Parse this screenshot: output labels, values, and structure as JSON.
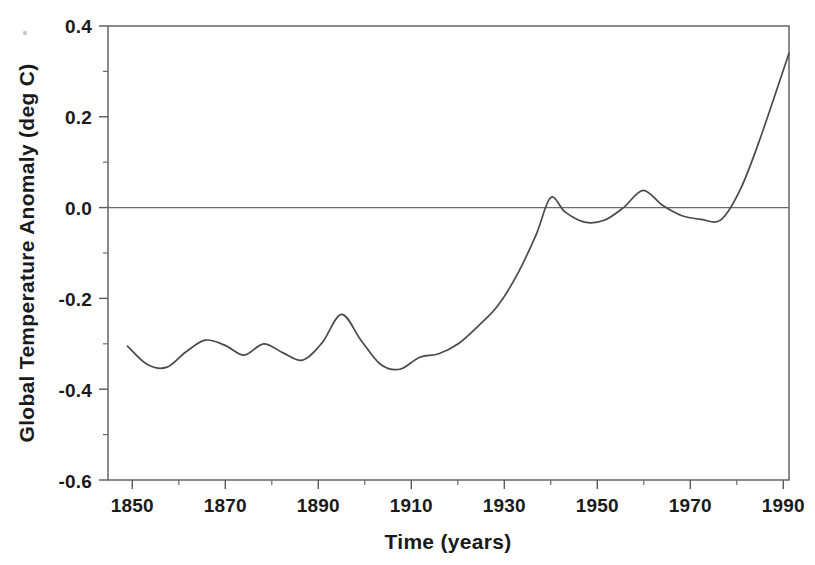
{
  "chart_data": {
    "type": "line",
    "title": "",
    "xlabel": "Time (years)",
    "ylabel": "Global Temperature Anomaly (deg C)",
    "xlim": [
      1850,
      1990
    ],
    "ylim": [
      -0.6,
      0.4
    ],
    "grid": false,
    "legend": null,
    "zero_reference_line": 0.0,
    "x_major_ticks": [
      1850,
      1870,
      1890,
      1910,
      1930,
      1950,
      1970,
      1990
    ],
    "x_tick_labels": [
      "1850",
      "1870",
      "1890",
      "1910",
      "1930",
      "1950",
      "1970",
      "1990"
    ],
    "x_minor_ticks": [
      1860,
      1880,
      1900,
      1920,
      1940,
      1960,
      1980
    ],
    "y_major_ticks": [
      0.4,
      0.2,
      0.0,
      -0.2,
      -0.4,
      -0.6
    ],
    "y_tick_labels": [
      "0.4",
      "0.2",
      "0.0",
      "-0.2",
      "-0.4",
      "-0.6"
    ],
    "y_minor_ticks": [
      0.3,
      0.1,
      -0.1,
      -0.3,
      -0.5
    ],
    "series": [
      {
        "name": "Global temperature anomaly (smoothed)",
        "color": "#4a4a4a",
        "x": [
          1854,
          1858,
          1862,
          1866,
          1870,
          1874,
          1878,
          1882,
          1886,
          1890,
          1894,
          1898,
          1902,
          1906,
          1910,
          1914,
          1918,
          1922,
          1926,
          1930,
          1934,
          1938,
          1941,
          1944,
          1948,
          1952,
          1956,
          1960,
          1964,
          1968,
          1972,
          1976,
          1980,
          1984,
          1990
        ],
        "y": [
          -0.305,
          -0.345,
          -0.352,
          -0.318,
          -0.292,
          -0.303,
          -0.325,
          -0.3,
          -0.32,
          -0.336,
          -0.298,
          -0.235,
          -0.292,
          -0.345,
          -0.356,
          -0.33,
          -0.322,
          -0.3,
          -0.262,
          -0.218,
          -0.15,
          -0.06,
          0.022,
          -0.01,
          -0.032,
          -0.028,
          0.0,
          0.038,
          0.005,
          -0.018,
          -0.026,
          -0.027,
          0.04,
          0.15,
          0.34
        ]
      }
    ],
    "annotations": []
  },
  "axes": {
    "y_axis_title": "Global Temperature Anomaly (deg C)",
    "x_axis_title": "Time (years)"
  },
  "icons": {
    "speck": "dust-speck"
  }
}
